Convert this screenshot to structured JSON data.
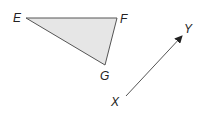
{
  "diagram": {
    "triangle": {
      "fill": "#e6e6e6",
      "stroke": "#555555",
      "vertices": {
        "E": {
          "label": "E",
          "x": 26,
          "y": 18
        },
        "F": {
          "label": "F",
          "x": 117,
          "y": 18
        },
        "G": {
          "label": "G",
          "x": 105,
          "y": 65
        }
      }
    },
    "vector": {
      "stroke": "#555555",
      "start": {
        "label": "X",
        "x": 126,
        "y": 96
      },
      "end": {
        "label": "Y",
        "x": 182,
        "y": 36
      }
    }
  }
}
